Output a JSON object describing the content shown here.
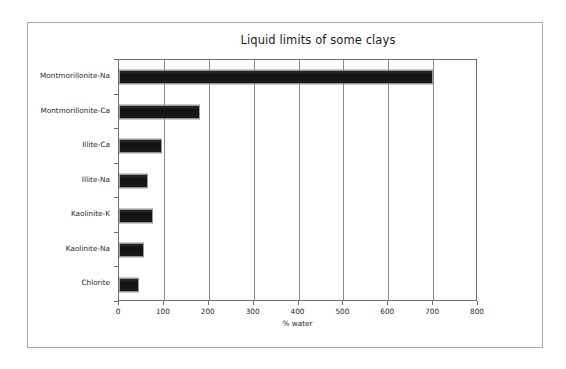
{
  "chart_data": {
    "type": "bar",
    "orientation": "horizontal",
    "title": "Liquid limits of some clays",
    "xlabel": "% water",
    "ylabel": "",
    "categories": [
      "Montmorillonite-Na",
      "Montmorillonite-Ca",
      "Illite-Ca",
      "Illite-Na",
      "Kaolinite-K",
      "Kaolinite-Na",
      "Chlorite"
    ],
    "values": [
      700,
      180,
      95,
      65,
      75,
      55,
      45
    ],
    "xlim": [
      0,
      800
    ],
    "xticks": [
      0,
      100,
      200,
      300,
      400,
      500,
      600,
      700,
      800
    ],
    "xtick_labels": [
      "0",
      "100",
      "200",
      "300",
      "400",
      "500",
      "600",
      "700",
      "800"
    ],
    "grid": "vertical",
    "legend": "none",
    "bar_color": "#141414",
    "plot_border_color": "#6f6f6f",
    "gridline_color": "#8a8a8a",
    "text_color": "#2a2a2a",
    "background": "#ffffff"
  }
}
